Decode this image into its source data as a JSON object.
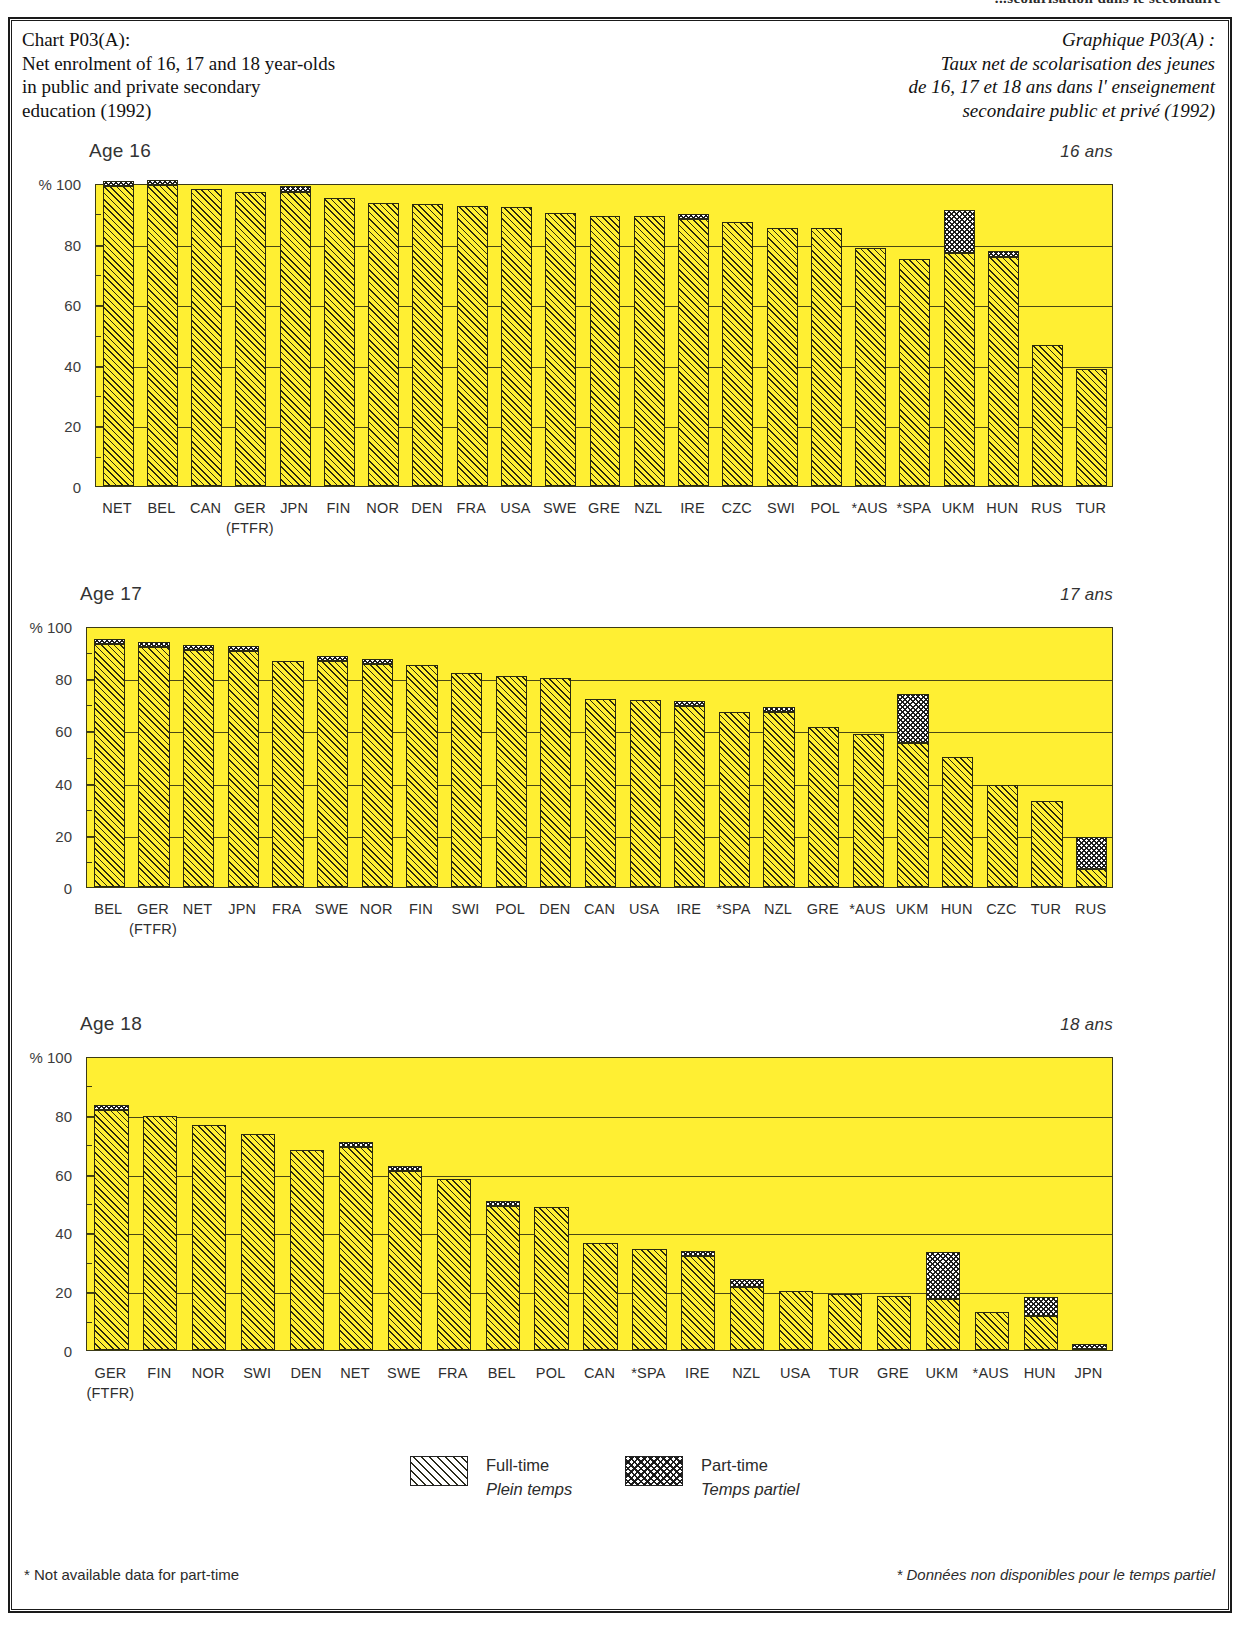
{
  "running_header": "...scolarisation dans le secondaire",
  "title": {
    "en_lines": [
      "Chart P03(A):",
      "Net enrolment of 16, 17 and 18 year-olds",
      "in public and private secondary",
      "education (1992)"
    ],
    "fr_lines": [
      "Graphique P03(A) :",
      "Taux net de scolarisation des jeunes",
      "de 16, 17 et 18 ans dans l' enseignement",
      "secondaire public et privé (1992)"
    ]
  },
  "legend": {
    "fulltime_en": "Full-time",
    "fulltime_fr": "Plein temps",
    "parttime_en": "Part-time",
    "parttime_fr": "Temps partiel"
  },
  "footnotes": {
    "left": "* Not available data for part-time",
    "right": "* Données non disponibles pour le temps partiel"
  },
  "axis": {
    "unit": "%",
    "ticks": [
      "100",
      "80",
      "60",
      "40",
      "20",
      "0"
    ],
    "ylim": [
      0,
      100
    ]
  },
  "colors": {
    "plot_background": "#ffef33",
    "axis_line": "#3b3a15",
    "hatch": "#191910",
    "text": "#2e2e2e"
  },
  "chart_data": [
    {
      "type": "bar",
      "title": "Age 16",
      "title_fr": "16 ans",
      "xlabel": "",
      "ylabel": "%",
      "ylim": [
        0,
        100
      ],
      "grid": true,
      "legend_position": "bottom",
      "stacked": true,
      "categories": [
        "NET",
        "BEL",
        "CAN",
        "GER",
        "JPN",
        "FIN",
        "NOR",
        "DEN",
        "FRA",
        "USA",
        "SWE",
        "GRE",
        "NZL",
        "IRE",
        "CZC",
        "SWI",
        "POL",
        "*AUS",
        "*SPA",
        "UKM",
        "HUN",
        "RUS",
        "TUR"
      ],
      "category_sublabels": [
        "",
        "",
        "",
        "(FTFR)",
        "",
        "",
        "",
        "",
        "",
        "",
        "",
        "",
        "",
        "",
        "",
        "",
        "",
        "",
        "",
        "",
        "",
        "",
        ""
      ],
      "series": [
        {
          "name": "Full-time",
          "values": [
            99.0,
            99.5,
            98.0,
            97.0,
            97.0,
            95.0,
            93.5,
            93.0,
            92.5,
            92.0,
            90.0,
            89.0,
            89.0,
            88.0,
            87.0,
            85.0,
            85.0,
            78.5,
            75.0,
            77.0,
            75.5,
            46.5,
            38.5
          ]
        },
        {
          "name": "Part-time",
          "values": [
            1.5,
            1.5,
            0.0,
            0.0,
            2.0,
            0.0,
            0.0,
            0.0,
            0.0,
            0.0,
            0.0,
            0.0,
            0.0,
            1.5,
            0.0,
            0.0,
            0.0,
            0.0,
            0.0,
            14.0,
            2.0,
            0.0,
            0.0
          ]
        }
      ]
    },
    {
      "type": "bar",
      "title": "Age 17",
      "title_fr": "17 ans",
      "xlabel": "",
      "ylabel": "%",
      "ylim": [
        0,
        100
      ],
      "grid": true,
      "legend_position": "bottom",
      "stacked": true,
      "categories": [
        "BEL",
        "GER",
        "NET",
        "JPN",
        "FRA",
        "SWE",
        "NOR",
        "FIN",
        "SWI",
        "POL",
        "DEN",
        "CAN",
        "USA",
        "IRE",
        "*SPA",
        "NZL",
        "GRE",
        "*AUS",
        "UKM",
        "HUN",
        "CZC",
        "TUR",
        "RUS"
      ],
      "category_sublabels": [
        "",
        "(FTFR)",
        "",
        "",
        "",
        "",
        "",
        "",
        "",
        "",
        "",
        "",
        "",
        "",
        "",
        "",
        "",
        "",
        "",
        "",
        "",
        "",
        ""
      ],
      "series": [
        {
          "name": "Full-time",
          "values": [
            93.0,
            92.0,
            91.0,
            90.5,
            86.5,
            86.5,
            85.5,
            85.0,
            82.0,
            81.0,
            80.0,
            72.0,
            71.5,
            69.5,
            67.0,
            67.0,
            61.5,
            58.5,
            55.0,
            50.0,
            39.0,
            33.0,
            7.0
          ]
        },
        {
          "name": "Part-time",
          "values": [
            2.0,
            1.5,
            1.5,
            2.0,
            0.0,
            1.5,
            1.5,
            0.0,
            0.0,
            0.0,
            0.0,
            0.0,
            0.0,
            1.0,
            0.0,
            1.0,
            0.0,
            0.0,
            19.0,
            0.0,
            0.0,
            0.0,
            12.0
          ]
        }
      ]
    },
    {
      "type": "bar",
      "title": "Age 18",
      "title_fr": "18 ans",
      "xlabel": "",
      "ylabel": "%",
      "ylim": [
        0,
        100
      ],
      "grid": true,
      "legend_position": "bottom",
      "stacked": true,
      "categories": [
        "GER",
        "FIN",
        "NOR",
        "SWI",
        "DEN",
        "NET",
        "SWE",
        "FRA",
        "BEL",
        "POL",
        "CAN",
        "*SPA",
        "IRE",
        "NZL",
        "USA",
        "TUR",
        "GRE",
        "UKM",
        "*AUS",
        "HUN",
        "JPN"
      ],
      "category_sublabels": [
        "(FTFR)",
        "",
        "",
        "",
        "",
        "",
        "",
        "",
        "",
        "",
        "",
        "",
        "",
        "",
        "",
        "",
        "",
        "",
        "",
        "",
        ""
      ],
      "series": [
        {
          "name": "Full-time",
          "values": [
            81.5,
            79.5,
            76.5,
            73.5,
            68.0,
            69.0,
            61.0,
            58.0,
            49.0,
            48.5,
            36.5,
            34.5,
            32.0,
            21.5,
            20.0,
            19.0,
            18.5,
            17.5,
            13.0,
            11.5,
            0.5
          ]
        },
        {
          "name": "Part-time",
          "values": [
            1.5,
            0.0,
            0.0,
            0.0,
            0.0,
            1.5,
            1.5,
            0.0,
            1.0,
            0.0,
            0.0,
            0.0,
            1.5,
            2.5,
            0.0,
            0.0,
            0.0,
            16.0,
            0.0,
            6.5,
            0.5
          ]
        }
      ]
    }
  ]
}
